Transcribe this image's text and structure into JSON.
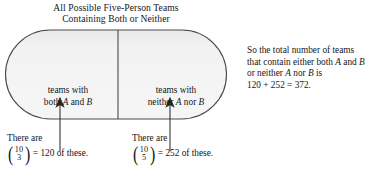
{
  "figure": {
    "title": {
      "line1": "All Possible Five-Person Teams",
      "line2": "Containing Both or Neither"
    },
    "diagram": {
      "type": "capsule-partition",
      "fill_color": "#f1f1f1",
      "stroke_color": "#4a4a4a",
      "cells": [
        {
          "id": "both",
          "label_line1": "teams with",
          "label_line2_pre": "both ",
          "label_line2_var1": "A",
          "label_line2_mid": " and ",
          "label_line2_var2": "B"
        },
        {
          "id": "neither",
          "label_line1": "teams with",
          "label_line2_pre": "neither ",
          "label_line2_var1": "A",
          "label_line2_mid": " nor ",
          "label_line2_var2": "B"
        }
      ]
    },
    "callouts": [
      {
        "id": "left-callout",
        "head": "There are",
        "binomial_n": "10",
        "binomial_k": "3",
        "tail": "= 120 of these.",
        "value": "120"
      },
      {
        "id": "right-callout",
        "head": "There are",
        "binomial_n": "10",
        "binomial_k": "5",
        "tail": "= 252 of these.",
        "value": "252"
      }
    ],
    "explanation": {
      "line1": "So the total number of teams",
      "line2_pre": "that contain either both ",
      "line2_var1": "A",
      "line2_mid": " and ",
      "line2_var2": "B",
      "line3_pre": "or neither ",
      "line3_var1": "A",
      "line3_mid": " nor ",
      "line3_var2": "B",
      "line3_post": " is",
      "line4": "120 + 252 = 372."
    }
  }
}
